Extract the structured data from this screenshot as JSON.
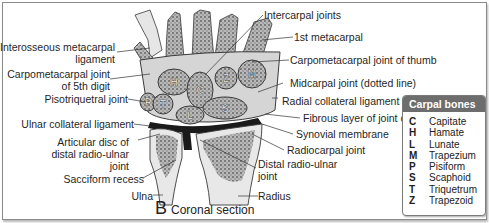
{
  "figure": {
    "panel_letter": "B",
    "panel_title": "Coronal section"
  },
  "labels_left": [
    {
      "text": "Interosseous metacarpal\nligament"
    },
    {
      "text": "Carpometacarpal joint\nof 5th digit"
    },
    {
      "text": "Pisotriquetral joint"
    },
    {
      "text": "Ulnar collateral ligament"
    },
    {
      "text": "Articular disc of\ndistal radio-ulnar\njoint"
    },
    {
      "text": "Sacciform recess"
    },
    {
      "text": "Ulna"
    }
  ],
  "labels_right": [
    {
      "text": "Intercarpal joints"
    },
    {
      "text": "1st metacarpal"
    },
    {
      "text": "Carpometacarpal joint of thumb"
    },
    {
      "text": "Midcarpal joint (dotted line)"
    },
    {
      "text": "Radial collateral ligament"
    },
    {
      "text": "Fibrous layer of joint capsule"
    },
    {
      "text": "Synovial membrane"
    },
    {
      "text": "Radiocarpal joint"
    },
    {
      "text": "Distal radio-ulnar\njoint"
    },
    {
      "text": "Radius"
    }
  ],
  "bone_markers": [
    "H",
    "C",
    "Z",
    "M",
    "P",
    "T",
    "L",
    "S"
  ],
  "legend": {
    "title": "Carpal bones",
    "items": [
      {
        "key": "C",
        "name": "Capitate"
      },
      {
        "key": "H",
        "name": "Hamate"
      },
      {
        "key": "L",
        "name": "Lunate"
      },
      {
        "key": "M",
        "name": "Trapezium"
      },
      {
        "key": "P",
        "name": "Pisiform"
      },
      {
        "key": "S",
        "name": "Scaphoid"
      },
      {
        "key": "T",
        "name": "Triquetrum"
      },
      {
        "key": "Z",
        "name": "Trapezoid"
      }
    ]
  },
  "colors": {
    "bone_fill": "#c9c9c9",
    "bone_texture": "#6e6e6e",
    "outline": "#3a3a3a",
    "legend_header": "#6d6d6d",
    "frame": "#8a8a8a"
  }
}
